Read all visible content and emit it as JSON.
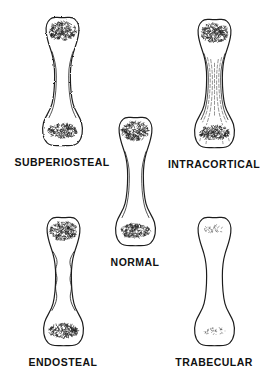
{
  "diagram": {
    "background": "#ffffff",
    "ink": "#1c1c1c",
    "faint_ink": "#2e2e2e",
    "figures": [
      {
        "id": "subperiosteal",
        "label": "SUBPERIOSTEAL",
        "variant": "subperiosteal"
      },
      {
        "id": "intracortical",
        "label": "INTRACORTICAL",
        "variant": "intracortical"
      },
      {
        "id": "normal",
        "label": "NORMAL",
        "variant": "normal"
      },
      {
        "id": "endosteal",
        "label": "ENDOSTEAL",
        "variant": "endosteal"
      },
      {
        "id": "trabecular",
        "label": "TRABECULAR",
        "variant": "trabecular"
      }
    ]
  }
}
